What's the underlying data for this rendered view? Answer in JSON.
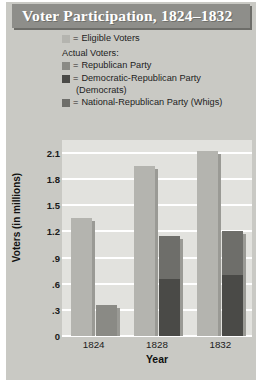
{
  "title": "Voter Participation, 1824–1832",
  "legend": {
    "eligible": {
      "swatch": "light-gray-swatch",
      "eq": "=",
      "label": "Eligible Voters",
      "color": "#b4b4af"
    },
    "actual_heading": "Actual Voters:",
    "items": [
      {
        "swatch": "medium-gray-swatch",
        "eq": "=",
        "label": "Republican Party",
        "color": "#8a8a85"
      },
      {
        "swatch": "dark-gray-swatch",
        "eq": "=",
        "label": "Democratic-Republican Party",
        "label_cont": "(Democrats)",
        "color": "#4a4a47"
      },
      {
        "swatch": "mid-dark-gray-swatch",
        "eq": "=",
        "label": "National-Republican Party (Whigs)",
        "color": "#6e6e6a"
      }
    ]
  },
  "chart_data": {
    "type": "bar",
    "title": "Voter Participation, 1824–1832",
    "xlabel": "Year",
    "ylabel": "Voters (in millions)",
    "categories": [
      "1824",
      "1828",
      "1832"
    ],
    "ylim": [
      0,
      2.25
    ],
    "yticks": [
      "0",
      ".3",
      ".6",
      ".9",
      "1.2",
      "1.5",
      "1.8",
      "2.1"
    ],
    "ytick_values": [
      0,
      0.3,
      0.6,
      0.9,
      1.2,
      1.5,
      1.8,
      2.1
    ],
    "grid": true,
    "legend_position": "top",
    "series": [
      {
        "name": "Eligible Voters",
        "color": "#b4b4af",
        "stacked": false,
        "values": [
          1.35,
          1.95,
          2.12
        ]
      },
      {
        "name": "Republican Party",
        "color": "#8a8a85",
        "stacked": true,
        "values": [
          0.36,
          0,
          0
        ]
      },
      {
        "name": "Democratic-Republican Party (Democrats)",
        "color": "#4a4a47",
        "stacked": true,
        "values": [
          0,
          0.65,
          0.7
        ]
      },
      {
        "name": "National-Republican Party (Whigs)",
        "color": "#6e6e6a",
        "stacked": true,
        "values": [
          0,
          0.5,
          0.5
        ]
      }
    ]
  }
}
